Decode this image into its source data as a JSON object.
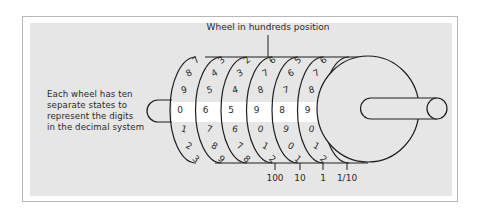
{
  "diagram": {
    "title_label": "Wheel in hundreds position",
    "caption_lines": [
      "Each wheel has ten",
      "separate states to",
      "represent the digits",
      "in the decimal system"
    ],
    "wheels": [
      {
        "digits_above": [
          "7",
          "8",
          "9"
        ],
        "current": "0",
        "digits_below": [
          "1",
          "2",
          "3"
        ]
      },
      {
        "digits_above": [
          "3",
          "4",
          "5"
        ],
        "current": "6",
        "digits_below": [
          "7",
          "8",
          "9"
        ]
      },
      {
        "digits_above": [
          "2",
          "3",
          "4"
        ],
        "current": "5",
        "digits_below": [
          "6",
          "7",
          "8"
        ]
      },
      {
        "digits_above": [
          "6",
          "7",
          "8"
        ],
        "current": "9",
        "digits_below": [
          "0",
          "1",
          "2"
        ]
      },
      {
        "digits_above": [
          "5",
          "6",
          "7"
        ],
        "current": "8",
        "digits_below": [
          "9",
          "0",
          "1"
        ]
      },
      {
        "digits_above": [
          "6",
          "7",
          "8"
        ],
        "current": "9",
        "digits_below": [
          "0",
          "1",
          "2"
        ]
      }
    ],
    "position_labels": [
      "100",
      "10",
      "1",
      "1/10"
    ],
    "colors": {
      "panel": "#e6e6e6",
      "band": "#ffffff",
      "ink": "#1e1e1e"
    }
  }
}
